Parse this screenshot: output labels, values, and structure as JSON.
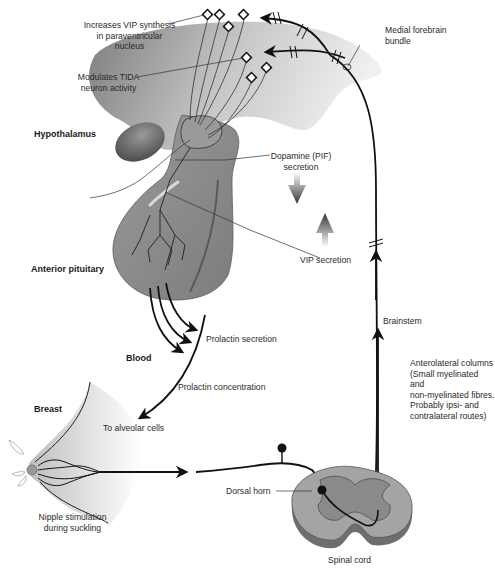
{
  "diagram": {
    "regions": {
      "hypothalamus": "Hypothalamus",
      "anterior_pituitary": "Anterior pituitary",
      "blood": "Blood",
      "breast": "Breast"
    },
    "labels": {
      "vip_synthesis": "Increases VIP synthesis\nin paraventricular nucleus",
      "tida": "Modulates TIDA\nneuron activity",
      "medial_forebrain": "Medial forebrain\nbundle",
      "dopamine": "Dopamine (PIF)\nsecretion",
      "vip_secretion": "VIP secretion",
      "brainstem": "Brainstem",
      "prolactin_secretion": "Prolactin secretion",
      "prolactin_concentration": "Prolactin concentration",
      "alveolar": "To alveolar cells",
      "anterolateral": "Anterolateral columns\n(Small myelinated and\nnon-myelinated fibres.\nProbably ipsi- and\ncontralateral routes)",
      "nipple": "Nipple stimulation\nduring suckling",
      "dorsal_horn": "Dorsal horn",
      "spinal_cord": "Spinal cord"
    },
    "colors": {
      "hypothalamus_dark": "#8a8a8a",
      "hypothalamus_light": "#ececec",
      "pituitary": "#8c8c8c",
      "pituitary_stroke": "#555555",
      "line": "#111111",
      "spinal_outer": "#7a7a7a",
      "spinal_grey": "#a8a8a8"
    }
  }
}
